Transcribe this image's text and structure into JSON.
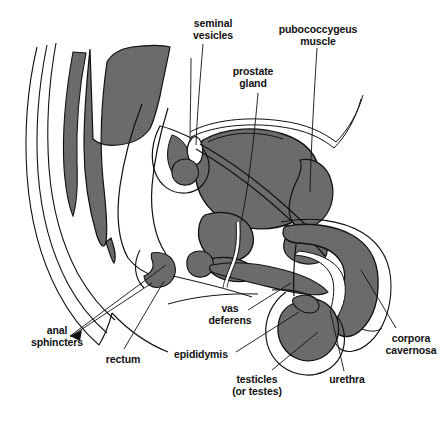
{
  "figure": {
    "type": "anatomical-diagram",
    "background_color": "#ffffff",
    "line_color": "#111111",
    "fill_color": "#6b6b6b",
    "highlight_color": "#ffffff"
  },
  "labels": {
    "seminal_vesicles": "seminal\nvesicles",
    "pubococcygeus_muscle": "pubococcygeus\nmuscle",
    "prostate_gland": "prostate\ngland",
    "anal_sphincters": "anal\nsphincters",
    "rectum": "rectum",
    "vas_deferens": "vas\ndeferens",
    "epididymis": "epididymis",
    "testicles": "testicles\n(or testes)",
    "urethra": "urethra",
    "corpora_cavernosa": "corpora\ncavernosa"
  },
  "label_positions": [
    {
      "name": "seminal-vesicles",
      "x": 177,
      "y": 18,
      "width": 72
    },
    {
      "name": "pubococcygeus-muscle",
      "x": 271,
      "y": 24,
      "width": 94
    },
    {
      "name": "prostate-gland",
      "x": 220,
      "y": 66,
      "width": 66
    },
    {
      "name": "anal-sphincters",
      "x": 23,
      "y": 325,
      "width": 68
    },
    {
      "name": "rectum",
      "x": 98,
      "y": 354,
      "width": 50
    },
    {
      "name": "vas-deferens",
      "x": 202,
      "y": 303,
      "width": 56
    },
    {
      "name": "epididymis",
      "x": 168,
      "y": 349,
      "width": 66
    },
    {
      "name": "testicles",
      "x": 226,
      "y": 374,
      "width": 62
    },
    {
      "name": "urethra",
      "x": 322,
      "y": 374,
      "width": 50
    },
    {
      "name": "corpora-cavernosa",
      "x": 380,
      "y": 333,
      "width": 62
    }
  ]
}
